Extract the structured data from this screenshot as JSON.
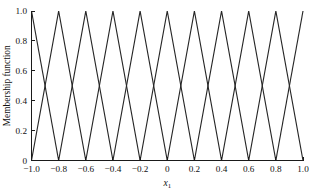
{
  "chart_data": {
    "type": "line",
    "title": "",
    "subtitle": "",
    "xlabel": "x",
    "xlabel_subscript": "1",
    "ylabel": "Membership function",
    "xlim": [
      -1.0,
      1.0
    ],
    "ylim": [
      0.0,
      1.0
    ],
    "grid": false,
    "legend": false,
    "legend_position": "none",
    "line_color": "#262626",
    "axis_color": "#1a1a1a",
    "background_color": "#ffffff",
    "xticks": [
      -1.0,
      -0.8,
      -0.6,
      -0.4,
      -0.2,
      0,
      0.2,
      0.4,
      0.6,
      0.8,
      1.0
    ],
    "xtick_labels": [
      "-1.0",
      "-0.8",
      "-0.6",
      "-0.4",
      "-0.2",
      "0",
      "0.2",
      "0.4",
      "0.6",
      "0.8",
      "1.0"
    ],
    "yticks": [
      0,
      0.2,
      0.4,
      0.6,
      0.8,
      1.0
    ],
    "ytick_labels": [
      "0",
      "0.2",
      "0.4",
      "0.6",
      "0.8",
      "1.0"
    ],
    "peak_spacing": 0.2,
    "half_width": 0.2,
    "crossing_value": 0.5,
    "n_series": 11,
    "series": [
      {
        "name": "mf1",
        "peak": -1.0,
        "left": -1.2,
        "right": -0.8,
        "x": [
          -1.2,
          -1.0,
          -0.8
        ],
        "values": [
          0,
          1,
          0
        ]
      },
      {
        "name": "mf2",
        "peak": -0.8,
        "left": -1.0,
        "right": -0.6,
        "x": [
          -1.0,
          -0.8,
          -0.6
        ],
        "values": [
          0,
          1,
          0
        ]
      },
      {
        "name": "mf3",
        "peak": -0.6,
        "left": -0.8,
        "right": -0.4,
        "x": [
          -0.8,
          -0.6,
          -0.4
        ],
        "values": [
          0,
          1,
          0
        ]
      },
      {
        "name": "mf4",
        "peak": -0.4,
        "left": -0.6,
        "right": -0.2,
        "x": [
          -0.6,
          -0.4,
          -0.2
        ],
        "values": [
          0,
          1,
          0
        ]
      },
      {
        "name": "mf5",
        "peak": -0.2,
        "left": -0.4,
        "right": 0.0,
        "x": [
          -0.4,
          -0.2,
          0.0
        ],
        "values": [
          0,
          1,
          0
        ]
      },
      {
        "name": "mf6",
        "peak": 0.0,
        "left": -0.2,
        "right": 0.2,
        "x": [
          -0.2,
          0.0,
          0.2
        ],
        "values": [
          0,
          1,
          0
        ]
      },
      {
        "name": "mf7",
        "peak": 0.2,
        "left": 0.0,
        "right": 0.4,
        "x": [
          0.0,
          0.2,
          0.4
        ],
        "values": [
          0,
          1,
          0
        ]
      },
      {
        "name": "mf8",
        "peak": 0.4,
        "left": 0.2,
        "right": 0.6,
        "x": [
          0.2,
          0.4,
          0.6
        ],
        "values": [
          0,
          1,
          0
        ]
      },
      {
        "name": "mf9",
        "peak": 0.6,
        "left": 0.4,
        "right": 0.8,
        "x": [
          0.4,
          0.6,
          0.8
        ],
        "values": [
          0,
          1,
          0
        ]
      },
      {
        "name": "mf10",
        "peak": 0.8,
        "left": 0.6,
        "right": 1.0,
        "x": [
          0.6,
          0.8,
          1.0
        ],
        "values": [
          0,
          1,
          0
        ]
      },
      {
        "name": "mf11",
        "peak": 1.0,
        "left": 0.8,
        "right": 1.2,
        "x": [
          0.8,
          1.0,
          1.2
        ],
        "values": [
          0,
          1,
          0
        ]
      }
    ]
  }
}
